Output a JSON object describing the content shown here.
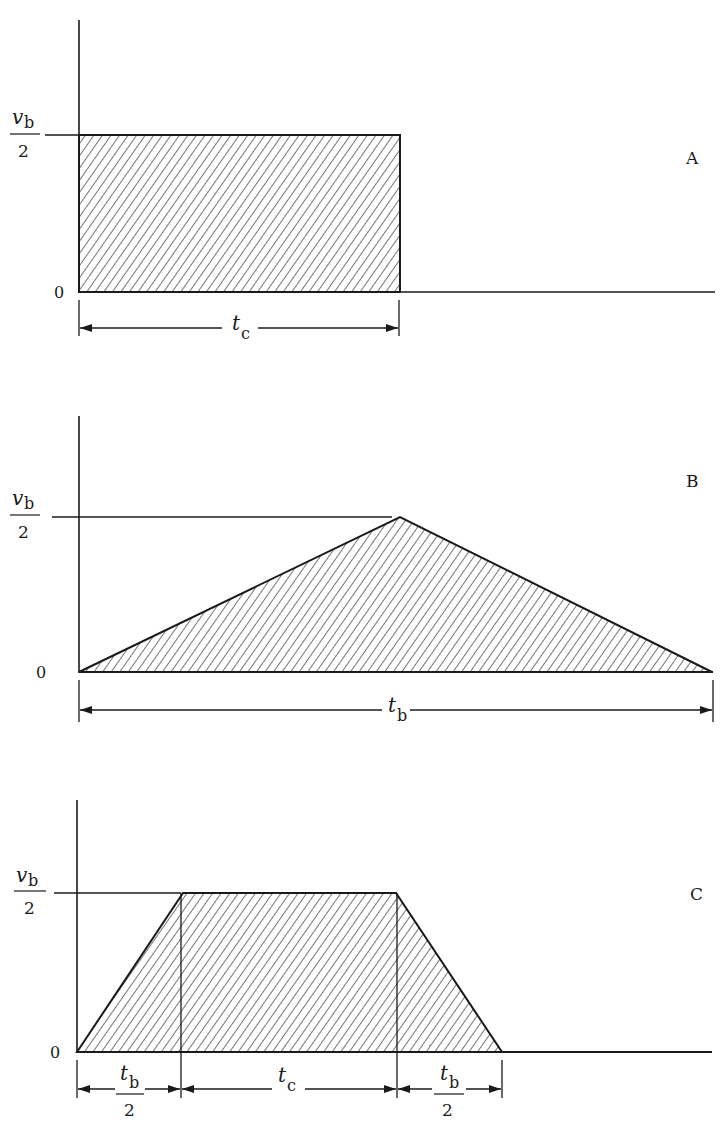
{
  "figure": {
    "ink_color": "#1a1a1a",
    "hatch_color": "#2a2a2a",
    "panels": [
      {
        "id": "A",
        "label": "A",
        "shape": "rectangle",
        "y_top_label": {
          "numerator": "v",
          "numerator_sub": "b",
          "denominator": "2"
        },
        "y_zero_label": "0",
        "dimension": {
          "symbol": "t",
          "sub": "c"
        }
      },
      {
        "id": "B",
        "label": "B",
        "shape": "triangle",
        "y_top_label": {
          "numerator": "v",
          "numerator_sub": "b",
          "denominator": "2"
        },
        "y_zero_label": "0",
        "dimension": {
          "symbol": "t",
          "sub": "b"
        }
      },
      {
        "id": "C",
        "label": "C",
        "shape": "trapezoid",
        "y_top_label": {
          "numerator": "v",
          "numerator_sub": "b",
          "denominator": "2"
        },
        "y_zero_label": "0",
        "dimensions": [
          {
            "symbol": "t",
            "sub": "b",
            "denominator": "2"
          },
          {
            "symbol": "t",
            "sub": "c"
          },
          {
            "symbol": "t",
            "sub": "b",
            "denominator": "2"
          }
        ]
      }
    ]
  }
}
